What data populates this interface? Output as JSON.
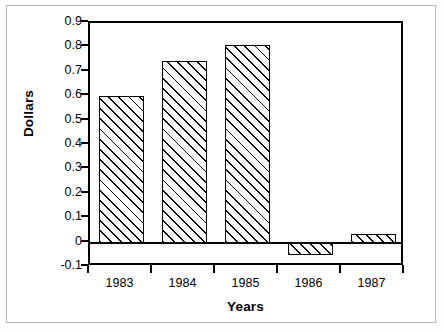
{
  "chart_data": {
    "type": "bar",
    "title": "",
    "xlabel": "Years",
    "ylabel": "Dollars",
    "categories": [
      "1983",
      "1984",
      "1985",
      "1986",
      "1987"
    ],
    "values": [
      0.6,
      0.745,
      0.81,
      -0.05,
      0.035
    ],
    "ylim": [
      -0.1,
      0.9
    ],
    "ytick_labels": [
      "0.9",
      "0.8",
      "0.7",
      "0.6",
      "0.5",
      "0.4",
      "0.3",
      "0.2",
      "0.1",
      "0",
      "-0.1"
    ],
    "ytick_values": [
      0.9,
      0.8,
      0.7,
      0.6,
      0.5,
      0.4,
      0.3,
      0.2,
      0.1,
      0.0,
      -0.1
    ],
    "grid": false,
    "legend": "none",
    "bar_style": {
      "fill": "diagonal-hatch",
      "edge_color": "#000000",
      "face_color": "#ffffff"
    }
  }
}
